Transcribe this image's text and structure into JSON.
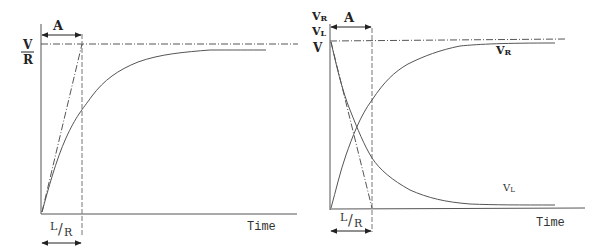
{
  "left_panel": {
    "interval_label": "A",
    "y_label_numerator": "V",
    "y_label_denominator": "R",
    "x_axis_label": "Time",
    "time_constant_numerator": "L",
    "time_constant_slash": "/",
    "time_constant_denominator": "R",
    "curve": "current rising exponentially toward V/R"
  },
  "right_panel": {
    "interval_label": "A",
    "y_labels": [
      "VR",
      "VL",
      "V"
    ],
    "y_label_vr_main": "V",
    "y_label_vr_sub": "R",
    "y_label_vl_main": "V",
    "y_label_vl_sub": "L",
    "y_label_v": "V",
    "curve_label_vr_main": "V",
    "curve_label_vr_sub": "R",
    "curve_label_vl_main": "V",
    "curve_label_vl_sub": "L",
    "x_axis_label": "Time",
    "time_constant_numerator": "L",
    "time_constant_slash": "/",
    "time_constant_denominator": "R"
  },
  "colors": {
    "line": "#555555",
    "text": "#222222",
    "background": "#ffffff"
  }
}
